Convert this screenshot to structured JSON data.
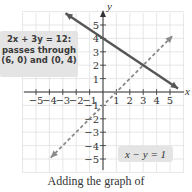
{
  "chart_data": {
    "type": "line",
    "title": "",
    "xlabel": "x",
    "ylabel": "y",
    "xlim": [
      -5.8,
      5.8
    ],
    "ylim": [
      -5.8,
      5.8
    ],
    "grid": true,
    "x_ticks": [
      "-5",
      "-4",
      "-3",
      "-2",
      "-1",
      "1",
      "2",
      "3",
      "4",
      "5"
    ],
    "y_ticks": [
      "5",
      "4",
      "3",
      "2",
      "1",
      "-1",
      "-2",
      "-3",
      "-4",
      "-5"
    ],
    "series": [
      {
        "name": "2x + 3y = 12",
        "style": "solid",
        "color": "#555555",
        "points": [
          [
            -2.8,
            5.87
          ],
          [
            5.6,
            0.27
          ]
        ]
      },
      {
        "name": "x - y = 1",
        "style": "dashed",
        "color": "#8a8a8a",
        "points": [
          [
            -3.9,
            -4.9
          ],
          [
            5.2,
            4.2
          ]
        ]
      }
    ],
    "annotations": [
      {
        "text": "2x + 3y = 12: passes through (6, 0) and (0, 4)",
        "line": "2x + 3y = 12"
      },
      {
        "text": "x − y = 1",
        "line": "x - y = 1"
      }
    ]
  },
  "labels": {
    "axis_x": "x",
    "axis_y": "y",
    "callout_line1": "2x + 3y = 12:",
    "callout_line2": "passes through",
    "callout_line3": "(6, 0) and (0, 4)",
    "callout_dashed": "x − y = 1",
    "caption": "Adding the graph of"
  }
}
